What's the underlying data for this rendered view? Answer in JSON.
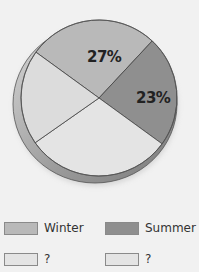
{
  "chart_data": {
    "type": "pie",
    "title": "",
    "slices": [
      {
        "name": "Winter",
        "value": 27,
        "label": "27%",
        "color": "#b9b9b9",
        "start_deg": -144,
        "end_deg": -47
      },
      {
        "name": "Summer",
        "value": 23,
        "label": "23%",
        "color": "#8f8f8f",
        "start_deg": -47,
        "end_deg": 36
      },
      {
        "name": "?",
        "value": null,
        "label": "",
        "color": "#e4e4e4",
        "start_deg": 36,
        "end_deg": 145
      },
      {
        "name": "?",
        "value": null,
        "label": "",
        "color": "#dcdcdc",
        "start_deg": 145,
        "end_deg": 216
      }
    ],
    "legend": [
      {
        "label": "Winter",
        "color": "#b9b9b9"
      },
      {
        "label": "Summer",
        "color": "#8f8f8f"
      },
      {
        "label": "?",
        "color": "#e4e4e4"
      },
      {
        "label": "?",
        "color": "#e4e4e4"
      }
    ],
    "legend_position": "bottom",
    "style": "3d-tilted"
  }
}
